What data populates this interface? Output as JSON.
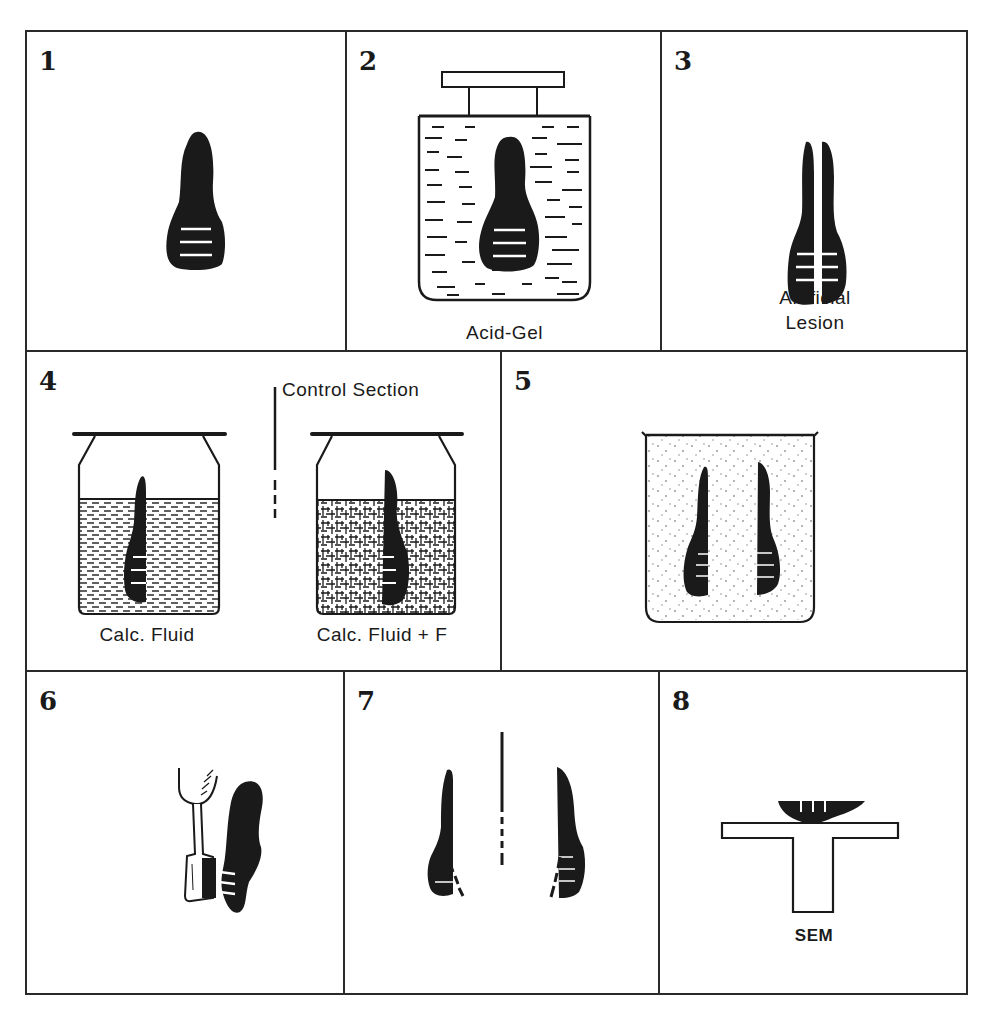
{
  "figure": {
    "panels": [
      {
        "number": "1",
        "label": "",
        "content": "tooth with three grooves"
      },
      {
        "number": "2",
        "label": "Acid-Gel",
        "content": "tooth immersed in acid gel container"
      },
      {
        "number": "3",
        "label_line1": "Artificial",
        "label_line2": "Lesion",
        "content": "sectioned tooth"
      },
      {
        "number": "4",
        "label_left": "Calc. Fluid",
        "label_right": "Calc. Fluid + F",
        "label_top": "Control Section",
        "content": "halves in two containers"
      },
      {
        "number": "5",
        "label": "",
        "content": "both halves in beaker"
      },
      {
        "number": "6",
        "label": "",
        "content": "brushing tooth"
      },
      {
        "number": "7",
        "label": "",
        "content": "sectioned halves"
      },
      {
        "number": "8",
        "label": "SEM",
        "content": "specimen on SEM stub"
      }
    ]
  },
  "colors": {
    "ink": "#1a1a1a",
    "border": "#2a2a2a",
    "background": "#ffffff"
  }
}
